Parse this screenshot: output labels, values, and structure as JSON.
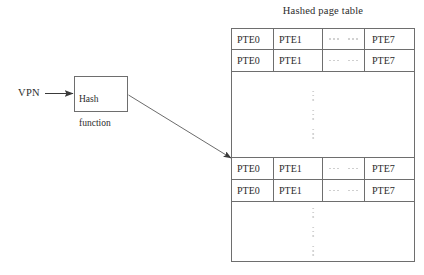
{
  "diagram": {
    "title": "Hashed page table",
    "input_label": "VPN",
    "hash_box": {
      "label": "Hash\nfunction",
      "line1": "Hash",
      "line2": "function"
    },
    "colors": {
      "stroke": "#6e6e6e",
      "text": "#2b2b2b",
      "arrow": "#4a4a4a",
      "dots": "#c9c9c9",
      "background": "#ffffff"
    },
    "arrows": [
      {
        "name": "vpn-to-hash",
        "from": "VPN",
        "to": "Hash function",
        "style": "straight"
      },
      {
        "name": "hash-to-bucket",
        "from": "Hash function",
        "to": "page table bucket",
        "style": "diagonal"
      }
    ]
  },
  "table": {
    "columns": [
      "PTE0",
      "PTE1",
      "ellipsis",
      "PTE7"
    ],
    "rows": [
      {
        "type": "entry",
        "cells": [
          "PTE0",
          "PTE1",
          "⋯",
          "PTE7"
        ]
      },
      {
        "type": "entry",
        "cells": [
          "PTE0",
          "PTE1",
          "⋯",
          "PTE7"
        ]
      },
      {
        "type": "ellipsis",
        "cells": [
          "",
          "",
          "⋮",
          ""
        ]
      },
      {
        "type": "entry",
        "cells": [
          "PTE0",
          "PTE1",
          "⋯",
          "PTE7"
        ]
      },
      {
        "type": "entry",
        "cells": [
          "PTE0",
          "PTE1",
          "⋯",
          "PTE7"
        ]
      },
      {
        "type": "ellipsis",
        "cells": [
          "",
          "",
          "⋮",
          ""
        ]
      }
    ]
  }
}
